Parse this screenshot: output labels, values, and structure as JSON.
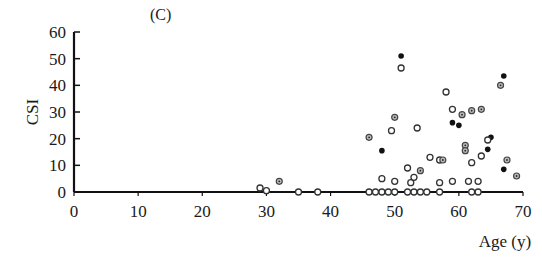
{
  "chart_data": {
    "type": "scatter",
    "title": "",
    "panel_label": "(C)",
    "xlabel": "Age  (y)",
    "ylabel": "CSI",
    "xlim": [
      0,
      70
    ],
    "ylim": [
      0,
      60
    ],
    "x_ticks": [
      0,
      10,
      20,
      30,
      40,
      50,
      60,
      70
    ],
    "y_ticks": [
      0,
      10,
      20,
      30,
      40,
      50,
      60
    ],
    "grid": false,
    "legend": null,
    "series": [
      {
        "name": "filled",
        "marker": "filled-circle",
        "points": [
          [
            51,
            51
          ],
          [
            48,
            15.5
          ],
          [
            59,
            26
          ],
          [
            60,
            25
          ],
          [
            64.5,
            16
          ],
          [
            65,
            20.5
          ],
          [
            67,
            43.5
          ],
          [
            67,
            8.5
          ]
        ]
      },
      {
        "name": "open",
        "marker": "open-circle",
        "points": [
          [
            29,
            1.5
          ],
          [
            30,
            0.5
          ],
          [
            35,
            0
          ],
          [
            38,
            0
          ],
          [
            46,
            0
          ],
          [
            47,
            0
          ],
          [
            48,
            0
          ],
          [
            49,
            0
          ],
          [
            50,
            0
          ],
          [
            52,
            0
          ],
          [
            53,
            0
          ],
          [
            54,
            0
          ],
          [
            55,
            0
          ],
          [
            57,
            0
          ],
          [
            63,
            0
          ],
          [
            51,
            46.5
          ],
          [
            58,
            37.5
          ],
          [
            49.5,
            23
          ],
          [
            53.5,
            24
          ],
          [
            48,
            5
          ],
          [
            50,
            4
          ],
          [
            52,
            9
          ],
          [
            52.5,
            3.5
          ],
          [
            53,
            5.5
          ],
          [
            55.5,
            13
          ],
          [
            57,
            12
          ],
          [
            57,
            3.5
          ],
          [
            59,
            4
          ],
          [
            59,
            31
          ],
          [
            61.5,
            4
          ],
          [
            62,
            11
          ],
          [
            63,
            4
          ],
          [
            63.5,
            13.5
          ],
          [
            64.5,
            19.5
          ],
          [
            62,
            0
          ]
        ]
      },
      {
        "name": "dotted-circle",
        "marker": "circle-with-dot",
        "points": [
          [
            32,
            4
          ],
          [
            46,
            20.5
          ],
          [
            50,
            28
          ],
          [
            54,
            8
          ],
          [
            57.5,
            12
          ],
          [
            61,
            17.5
          ],
          [
            61,
            15.5
          ],
          [
            60.5,
            29
          ],
          [
            62,
            30.5
          ],
          [
            63.5,
            31
          ],
          [
            66.5,
            40
          ],
          [
            67.5,
            12
          ],
          [
            69,
            6
          ]
        ]
      }
    ]
  }
}
